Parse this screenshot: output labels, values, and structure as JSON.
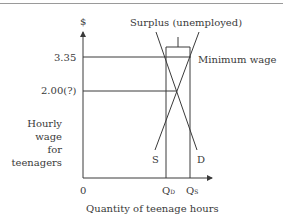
{
  "diagram": {
    "y_axis_symbol": "$",
    "y_axis_label_lines": [
      "Hourly",
      "wage",
      "for",
      "teenagers"
    ],
    "x_axis_label": "Quantity of teenage hours",
    "origin_label": "0",
    "price_ticks": [
      {
        "label": "3.35",
        "meaning": "minimum wage"
      },
      {
        "label": "2.00(?)",
        "meaning": "equilibrium wage"
      }
    ],
    "quantity_ticks": [
      {
        "letter": "Q",
        "subscript": "D"
      },
      {
        "letter": "Q",
        "subscript": "S"
      }
    ],
    "curves": {
      "supply_label": "S",
      "demand_label": "D"
    },
    "annotations": {
      "surplus": "Surplus (unemployed)",
      "minimum_wage": "Minimum wage"
    },
    "colors": {
      "line": "#3a3a3a",
      "background": "#ffffff"
    }
  }
}
